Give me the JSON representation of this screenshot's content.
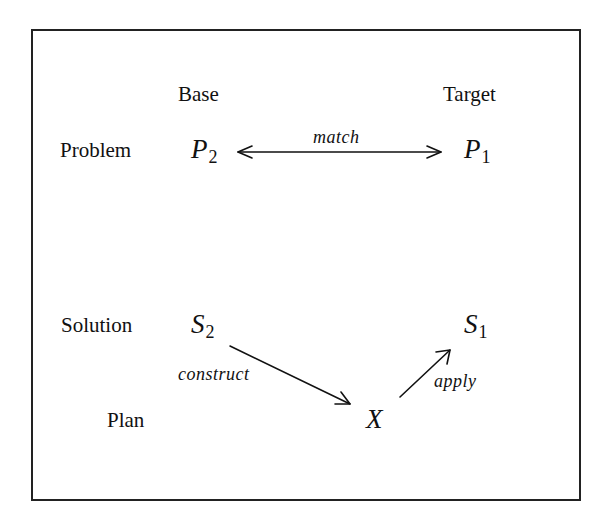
{
  "diagram": {
    "columns": {
      "base": "Base",
      "target": "Target"
    },
    "rows": {
      "problem": "Problem",
      "solution": "Solution",
      "plan": "Plan"
    },
    "nodes": {
      "p2": {
        "symbol": "P",
        "subscript": "2"
      },
      "p1": {
        "symbol": "P",
        "subscript": "1"
      },
      "s2": {
        "symbol": "S",
        "subscript": "2"
      },
      "s1": {
        "symbol": "S",
        "subscript": "1"
      },
      "x": {
        "symbol": "X"
      }
    },
    "edges": {
      "match": "match",
      "construct": "construct",
      "apply": "apply"
    }
  }
}
